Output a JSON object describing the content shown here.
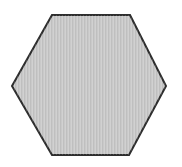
{
  "figure": {
    "shape_name": "hexagon",
    "background_color": "#ffffff",
    "fill_color": "#c9c9c9",
    "stroke_color": "#2e2e2e",
    "stroke_width": "2",
    "points": "52,15 130,15 166,86 129,155 52,155 12,86"
  }
}
